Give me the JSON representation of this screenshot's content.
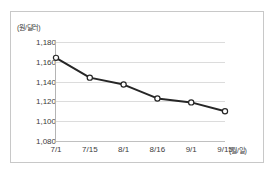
{
  "chart_data": {
    "type": "line",
    "title": "",
    "subtitle": "",
    "xlabel": "(월/일)",
    "ylabel": "(원/달러)",
    "categories": [
      "7/1",
      "7/15",
      "8/1",
      "8/16",
      "9/1",
      "9/15"
    ],
    "values": [
      1164,
      1144,
      1137,
      1123,
      1119,
      1110
    ],
    "series": [
      {
        "name": "원/달러 환율",
        "values": [
          1164,
          1144,
          1137,
          1123,
          1119,
          1110
        ]
      }
    ],
    "ylim": [
      1080,
      1180
    ],
    "ytick_labels": [
      "1,180",
      "1,160",
      "1,140",
      "1,120",
      "1,100",
      "1,080"
    ],
    "ytick_values": [
      1180,
      1160,
      1140,
      1120,
      1100,
      1080
    ],
    "grid": "horizontal",
    "legend": "none",
    "line_color": "#262626",
    "marker_fill": "#ffffff",
    "marker_edge": "#262626",
    "gridline_color": "#dcdcdc",
    "frame_color": "#c8c8c8"
  }
}
